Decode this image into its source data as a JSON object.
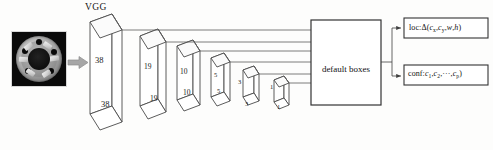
{
  "diagram": {
    "backbone_label": "VGG",
    "aggregator_label": "default boxes",
    "input": {
      "name": "input-image",
      "description": "grayscale photo of circular mechanical hub with bolt holes"
    },
    "feature_maps": [
      {
        "id": "fm-38",
        "size_top": "38",
        "size_bottom": "38"
      },
      {
        "id": "fm-19",
        "size_top": "19",
        "size_bottom": "19"
      },
      {
        "id": "fm-10",
        "size_top": "10",
        "size_bottom": "10"
      },
      {
        "id": "fm-5",
        "size_top": "5",
        "size_bottom": "5"
      },
      {
        "id": "fm-3",
        "size_top": "3",
        "size_bottom": "3"
      },
      {
        "id": "fm-1",
        "size_top": "1",
        "size_bottom": "1"
      }
    ],
    "outputs": [
      {
        "id": "loc-box",
        "prefix": "loc:Δ(",
        "terms": [
          "c",
          "c",
          "w",
          "h"
        ],
        "subs": [
          "x",
          "y",
          "",
          ""
        ],
        "suffix": ")"
      },
      {
        "id": "conf-box",
        "prefix": "conf:",
        "terms": [
          "c",
          "c",
          "c"
        ],
        "subs": [
          "1",
          "2",
          "p"
        ],
        "ellipsis": "···",
        "suffix": ")"
      }
    ],
    "colors": {
      "stroke": "#4a4a4a",
      "arrow_gray": "#9a9a9a",
      "text": "#111111",
      "background": "#fdfdfc"
    }
  }
}
